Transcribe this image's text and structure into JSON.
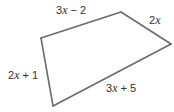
{
  "figure": {
    "type": "quadrilateral",
    "vertices": [
      "top-left",
      "top-right",
      "right",
      "bottom"
    ],
    "sides": [
      {
        "id": "top",
        "from": "top-left",
        "to": "top-right",
        "coef": "3",
        "variable": "x",
        "rest": " − 2",
        "expression": "3x − 2"
      },
      {
        "id": "upper-right",
        "from": "top-right",
        "to": "right",
        "coef": "2",
        "variable": "x",
        "rest": "",
        "expression": "2x"
      },
      {
        "id": "bottom",
        "from": "right",
        "to": "bottom",
        "coef": "3",
        "variable": "x",
        "rest": " + 5",
        "expression": "3x + 5"
      },
      {
        "id": "left",
        "from": "bottom",
        "to": "top-left",
        "coef": "2",
        "variable": "x",
        "rest": " + 1",
        "expression": "2x + 1"
      }
    ],
    "line_color": "#6b6b6b",
    "text_color": "#333333"
  }
}
